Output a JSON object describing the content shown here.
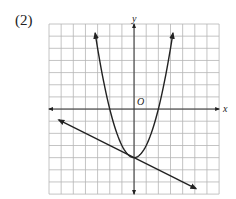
{
  "problem_label": "(2)",
  "chart_data": {
    "type": "line",
    "title": "",
    "xlabel": "x",
    "ylabel": "y",
    "origin_label": "O",
    "xlim": [
      -7,
      7
    ],
    "ylim": [
      -7,
      7
    ],
    "grid": true,
    "grid_step": 1,
    "series": [
      {
        "name": "parabola",
        "equation": "y = x^2 - 4",
        "x": [
          -3.2,
          -3,
          -2,
          -1,
          0,
          1,
          2,
          3,
          3.2
        ],
        "y": [
          6.24,
          5,
          0,
          -3,
          -4,
          -3,
          0,
          5,
          6.24
        ],
        "arrows": "both ends"
      },
      {
        "name": "line",
        "equation": "y = -0.5x - 4",
        "x": [
          -6.2,
          0,
          5.1
        ],
        "y": [
          -0.9,
          -4,
          -6.55
        ],
        "arrows": "both ends"
      }
    ],
    "intersection": [
      0,
      -4
    ]
  },
  "colors": {
    "grid": "#b5b5b5",
    "axes": "#333333",
    "curves": "#222222"
  }
}
